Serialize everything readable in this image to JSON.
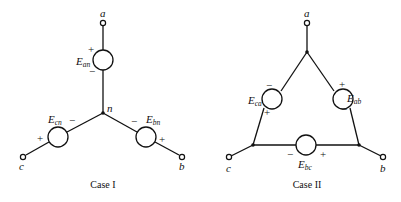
{
  "case1": {
    "caption": "Case I",
    "terminals": {
      "a": "a",
      "b": "b",
      "c": "c"
    },
    "neutral_label": "n",
    "sources": {
      "an": {
        "main": "E",
        "sub": "an",
        "top_sign": "+",
        "bottom_sign": "−"
      },
      "cn": {
        "main": "E",
        "sub": "cn",
        "inner_sign": "−",
        "outer_sign": "+"
      },
      "bn": {
        "main": "E",
        "sub": "bn",
        "inner_sign": "−",
        "outer_sign": "+"
      }
    }
  },
  "case2": {
    "caption": "Case II",
    "terminals": {
      "a": "a",
      "b": "b",
      "c": "c"
    },
    "sources": {
      "ca": {
        "main": "E",
        "sub": "ca",
        "top_sign": "−",
        "bottom_sign": "+"
      },
      "ab": {
        "main": "E",
        "sub": "ab",
        "top_sign": "+",
        "bottom_sign": "−"
      },
      "bc": {
        "main": "E",
        "sub": "bc",
        "left_sign": "−",
        "right_sign": "+"
      }
    }
  }
}
